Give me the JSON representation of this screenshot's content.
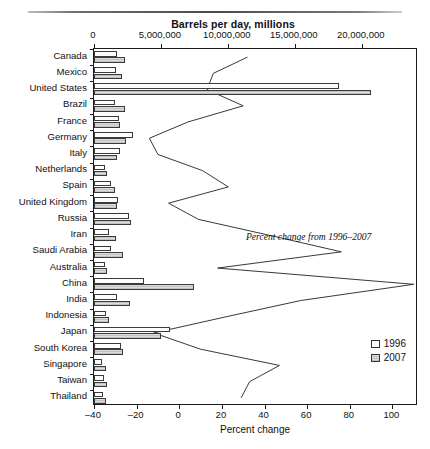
{
  "figure": {
    "top_axis_title": "Barrels per day, millions",
    "bottom_axis_title": "Percent change",
    "annotation": "Percent change from 1996–2007"
  },
  "legend": {
    "position": "bottom-right",
    "items": [
      {
        "label": "1996",
        "swatch": "open-square"
      },
      {
        "label": "2007",
        "swatch": "shaded-square"
      }
    ]
  },
  "chart_data": {
    "type": "bar",
    "title": "",
    "orientation": "horizontal",
    "grid": false,
    "legend_position": "bottom-right",
    "xlabel": "Barrels per day, millions",
    "xlabel_secondary": "Percent change",
    "top_axis_ticks": [
      "0",
      "5,000,000",
      "10,000,000",
      "15,000,000",
      "20,000,000"
    ],
    "top_axis_tick_values": [
      0,
      5000000,
      10000000,
      15000000,
      20000000
    ],
    "top_xlim": [
      0,
      24200000
    ],
    "bottom_axis_ticks": [
      "–40",
      "–20",
      "0",
      "20",
      "40",
      "60",
      "80",
      "100"
    ],
    "bottom_axis_tick_values": [
      -40,
      -20,
      0,
      20,
      40,
      60,
      80,
      100
    ],
    "bottom_xlim": [
      -40,
      112
    ],
    "categories": [
      "Canada",
      "Mexico",
      "United States",
      "Brazil",
      "France",
      "Germany",
      "Italy",
      "Netherlands",
      "Spain",
      "United Kingdom",
      "Russia",
      "Iran",
      "Saudi Arabia",
      "Australia",
      "China",
      "India",
      "Indonesia",
      "Japan",
      "South Korea",
      "Singapore",
      "Taiwan",
      "Thailand"
    ],
    "series": [
      {
        "name": "1996",
        "unit": "barrels per day",
        "values": [
          1750000,
          1680000,
          18300000,
          1600000,
          1900000,
          2900000,
          1950000,
          800000,
          1300000,
          1800000,
          2600000,
          1150000,
          1250000,
          800000,
          3700000,
          1700000,
          900000,
          5700000,
          2000000,
          600000,
          750000,
          700000
        ]
      },
      {
        "name": "2007",
        "unit": "barrels per day",
        "values": [
          2300000,
          2100000,
          20700000,
          2350000,
          1950000,
          2400000,
          1750000,
          1000000,
          1600000,
          1700000,
          2800000,
          1650000,
          2200000,
          950000,
          7500000,
          2700000,
          1100000,
          5000000,
          2200000,
          900000,
          1000000,
          900000
        ]
      }
    ],
    "percent_change_line": {
      "name": "Percent change from 1996–2007",
      "unit": "percent",
      "values": [
        32,
        16,
        13,
        30,
        4,
        -14,
        -10,
        11,
        23,
        -5,
        9,
        43,
        76,
        18,
        110,
        57,
        22,
        -12,
        10,
        47,
        33,
        29
      ]
    }
  }
}
